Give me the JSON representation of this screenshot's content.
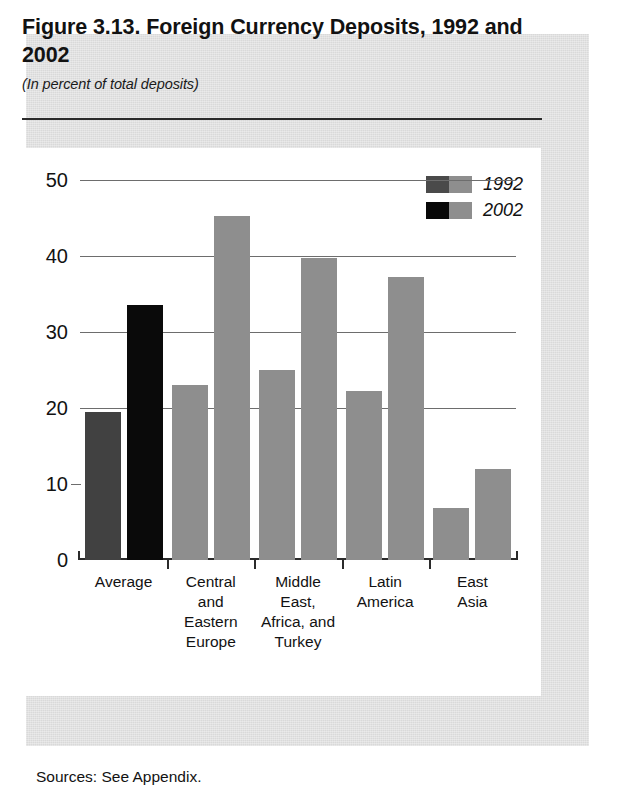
{
  "figure": {
    "title": "Figure 3.13. Foreign Currency Deposits, 1992 and 2002",
    "subtitle": "(In percent of total deposits)",
    "source_note": "Sources: See Appendix."
  },
  "legend": {
    "items": [
      {
        "label": "1992",
        "color": "#8e8e8e",
        "accent_color": "#4a4a4a"
      },
      {
        "label": "2002",
        "color": "#8e8e8e",
        "accent_color": "#080808"
      }
    ]
  },
  "axis": {
    "y_ticks": [
      "50",
      "40",
      "30",
      "20",
      "10",
      "0"
    ]
  },
  "chart_data": {
    "type": "bar",
    "title": "Figure 3.13. Foreign Currency Deposits, 1992 and 2002",
    "subtitle": "(In percent of total deposits)",
    "xlabel": "",
    "ylabel": "",
    "ylim": [
      0,
      50
    ],
    "y_ticks": [
      0,
      10,
      20,
      30,
      40,
      50
    ],
    "gridlines": [
      20,
      30,
      40,
      50
    ],
    "grid": true,
    "legend_position": "top-right",
    "categories": [
      "Average",
      "Central and Eastern Europe",
      "Middle East, Africa, and Turkey",
      "Latin America",
      "East Asia"
    ],
    "category_label_lines": [
      [
        "Average"
      ],
      [
        "Central",
        "and",
        "Eastern",
        "Europe"
      ],
      [
        "Middle",
        "East,",
        "Africa, and",
        "Turkey"
      ],
      [
        "Latin",
        "America"
      ],
      [
        "East",
        "Asia"
      ]
    ],
    "series": [
      {
        "name": "1992",
        "values": [
          19.5,
          23.0,
          25.0,
          22.2,
          6.8
        ]
      },
      {
        "name": "2002",
        "values": [
          33.5,
          45.3,
          39.8,
          37.3,
          12.0
        ]
      }
    ]
  }
}
